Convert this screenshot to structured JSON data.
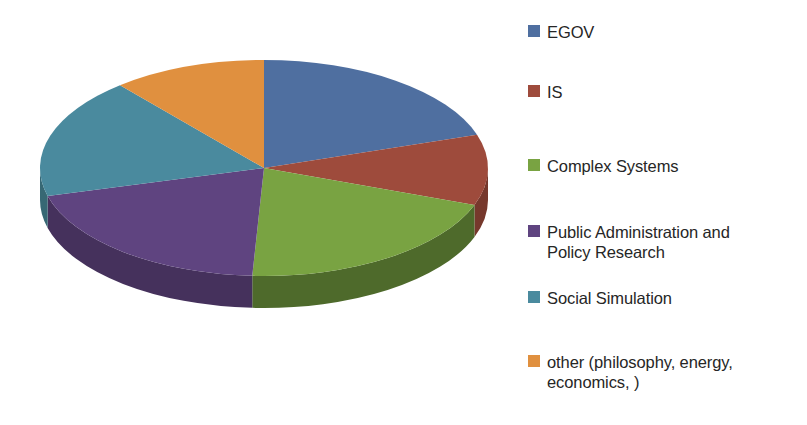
{
  "chart_data": {
    "type": "pie",
    "title": "",
    "three_d": true,
    "start_angle_deg": 0,
    "direction": "clockwise",
    "legend_position": "right",
    "grid": false,
    "categories": [
      "EGOV",
      "IS",
      "Complex Systems",
      "Public Administration and Policy Research",
      "Social Simulation",
      "other (philosophy, energy, economics, )"
    ],
    "values": [
      20,
      10.5,
      20.5,
      20,
      18,
      11
    ],
    "percentages": [
      20,
      10.5,
      20.5,
      20,
      18,
      11
    ],
    "colors": [
      "#4F6FA0",
      "#9E4B3C",
      "#79A342",
      "#5F4480",
      "#4A8A9E",
      "#E0903F"
    ],
    "slice_angles_deg": [
      {
        "start": 0,
        "end": 72
      },
      {
        "start": 72,
        "end": 110
      },
      {
        "start": 110,
        "end": 183
      },
      {
        "start": 183,
        "end": 255
      },
      {
        "start": 255,
        "end": 320
      },
      {
        "start": 320,
        "end": 360
      }
    ]
  },
  "legend": {
    "items": [
      {
        "label": "EGOV",
        "color": "#4F6FA0",
        "top": 22
      },
      {
        "label": "IS",
        "color": "#9E4B3C",
        "top": 82
      },
      {
        "label": "Complex Systems",
        "color": "#79A342",
        "top": 156
      },
      {
        "label": "Public Administration and\nPolicy Research",
        "color": "#5F4480",
        "top": 222
      },
      {
        "label": "Social Simulation",
        "color": "#4A8A9E",
        "top": 288
      },
      {
        "label": "other (philosophy, energy,\neconomics, )",
        "color": "#E0903F",
        "top": 352
      }
    ]
  },
  "pie": {
    "center_x": 264,
    "center_y": 168,
    "radius_x": 224,
    "radius_y": 108,
    "depth": 32,
    "slices": [
      {
        "name": "egov",
        "color_top": "#4F6FA0",
        "color_side": "#3C557A",
        "a0": 0,
        "a1": 72
      },
      {
        "name": "is",
        "color_top": "#9E4B3C",
        "color_side": "#76382C",
        "a0": 72,
        "a1": 110
      },
      {
        "name": "complex-systems",
        "color_top": "#79A342",
        "color_side": "#4E6A2B",
        "a0": 110,
        "a1": 183
      },
      {
        "name": "public-administration",
        "color_top": "#5F4480",
        "color_side": "#45315C",
        "a0": 183,
        "a1": 255
      },
      {
        "name": "social-simulation",
        "color_top": "#4A8A9E",
        "color_side": "#376874",
        "a0": 255,
        "a1": 320
      },
      {
        "name": "other",
        "color_top": "#E0903F",
        "color_side": "#A76A2E",
        "a0": 320,
        "a1": 360
      }
    ]
  }
}
